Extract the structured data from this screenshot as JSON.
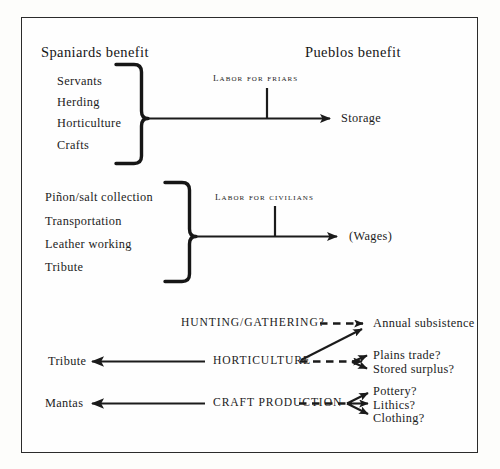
{
  "figure": {
    "headings": {
      "left": "Spaniards benefit",
      "right": "Pueblos benefit"
    },
    "groups": [
      {
        "name": "friars-group",
        "items": [
          "Servants",
          "Herding",
          "Horticulture",
          "Crafts"
        ],
        "flow_label": "LABOR FOR FRIARS",
        "outcome": "Storage"
      },
      {
        "name": "civilians-group",
        "items": [
          "Piñon/salt collection",
          "Transportation",
          "Leather working",
          "Tribute"
        ],
        "flow_label": "LABOR FOR CIVILIANS",
        "outcome": "(Wages)"
      }
    ],
    "bottom_rows": [
      {
        "name": "hunting-gathering-row",
        "source_label": "",
        "flow_label": "HUNTING/GATHERING?",
        "outcomes": [
          "Annual subsistence"
        ]
      },
      {
        "name": "horticulture-row",
        "source_label": "Tribute",
        "flow_label": "HORTICULTURE",
        "outcomes": [
          "Plains trade?",
          "Stored surplus?"
        ]
      },
      {
        "name": "craft-production-row",
        "source_label": "Mantas",
        "flow_label": "CRAFT PRODUCTION",
        "outcomes": [
          "Pottery?",
          "Lithics?",
          "Clothing?"
        ]
      }
    ]
  }
}
